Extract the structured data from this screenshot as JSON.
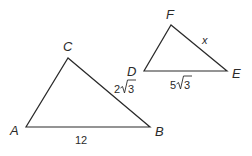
{
  "diagram": {
    "line_color": "#2a2a2a",
    "background": "#ffffff",
    "triangles": [
      {
        "name": "ABC",
        "vertices": {
          "A": {
            "label": "A",
            "x": 26,
            "y": 127
          },
          "B": {
            "label": "B",
            "x": 150,
            "y": 127
          },
          "C": {
            "label": "C",
            "x": 68,
            "y": 58
          }
        },
        "sides": {
          "AB": {
            "label": "12"
          },
          "BC": {
            "coef": "2",
            "radicand": "3"
          }
        }
      },
      {
        "name": "DEF",
        "vertices": {
          "D": {
            "label": "D",
            "x": 144,
            "y": 71
          },
          "E": {
            "label": "E",
            "x": 227,
            "y": 71
          },
          "F": {
            "label": "F",
            "x": 171,
            "y": 25
          }
        },
        "sides": {
          "DE": {
            "coef": "5",
            "radicand": "3"
          },
          "EF": {
            "label": "x"
          }
        }
      }
    ]
  }
}
